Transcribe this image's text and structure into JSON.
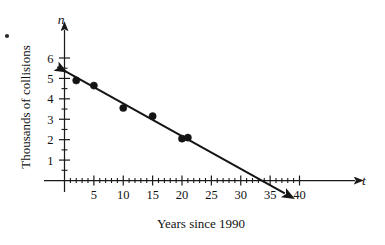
{
  "figure": {
    "axes": {
      "x_var_label": "t",
      "y_var_label": "n",
      "x_title": "Years since 1990",
      "y_title": "Thousands of collisions",
      "x_ticks": [
        5,
        10,
        15,
        20,
        25,
        30,
        35,
        40
      ],
      "y_ticks": [
        1,
        2,
        3,
        4,
        5,
        6
      ]
    },
    "marks": {
      "corner_bullet": "•"
    }
  },
  "chart_data": {
    "type": "scatter",
    "title": "",
    "subtitle": "",
    "xlabel": "Years since 1990",
    "ylabel": "Thousands of collisions",
    "x_axis_variable": "t",
    "y_axis_variable": "n",
    "xlim": [
      0,
      42
    ],
    "ylim": [
      0,
      6.5
    ],
    "xticks": [
      5,
      10,
      15,
      20,
      25,
      30,
      35,
      40
    ],
    "yticks": [
      1,
      2,
      3,
      4,
      5,
      6
    ],
    "x_minor_tick_step": 1,
    "y_minor_tick_step": 0.5,
    "grid": false,
    "legend": false,
    "legend_position": "none",
    "x": [
      2,
      5,
      10,
      15,
      20,
      21
    ],
    "y": [
      4.9,
      4.65,
      3.55,
      3.15,
      2.05,
      2.1
    ],
    "points": [
      {
        "t": 2,
        "n": 4.9
      },
      {
        "t": 5,
        "n": 4.65
      },
      {
        "t": 10,
        "n": 3.55
      },
      {
        "t": 15,
        "n": 3.15
      },
      {
        "t": 20,
        "n": 2.05
      },
      {
        "t": 21,
        "n": 2.1
      }
    ],
    "series": [
      {
        "name": "Collisions data",
        "type": "scatter",
        "values": [
          4.9,
          4.65,
          3.55,
          3.15,
          2.05,
          2.1
        ]
      },
      {
        "name": "Line of best fit",
        "type": "line",
        "intercept": 5.37,
        "slope": -0.16,
        "x_intercept": 33.6,
        "draw_from_x": -1.2,
        "draw_to_x": 37.5,
        "arrow_start": true,
        "arrow_end": true
      }
    ],
    "annotations": []
  }
}
